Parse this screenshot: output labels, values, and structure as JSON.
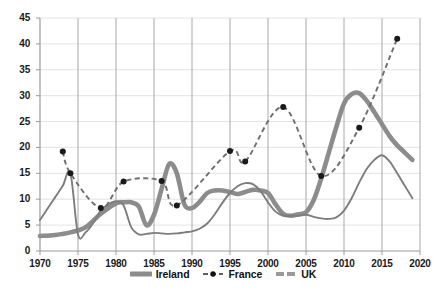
{
  "chart_data": {
    "type": "line",
    "title": "",
    "xlabel": "",
    "ylabel": "",
    "xlim": [
      1970,
      2020
    ],
    "ylim": [
      0,
      45
    ],
    "grid": true,
    "legend_position": "bottom-center",
    "x_ticks": [
      "1970",
      "1975",
      "1980",
      "1985",
      "1990",
      "1995",
      "2000",
      "2005",
      "2010",
      "2015",
      "2020"
    ],
    "y_ticks": [
      "0",
      "5",
      "10",
      "15",
      "20",
      "25",
      "30",
      "35",
      "40",
      "45"
    ],
    "series": [
      {
        "name": "Ireland",
        "color": "#8c8c8c",
        "style": "solid-thick",
        "x": [
          1970,
          1972,
          1974,
          1976,
          1978,
          1980,
          1981,
          1982,
          1983,
          1984,
          1985,
          1986,
          1987,
          1988,
          1989,
          1990,
          1991,
          1992,
          1993,
          1994,
          1995,
          1996,
          1997,
          1998,
          1999,
          2000,
          2001,
          2002,
          2003,
          2004,
          2005,
          2006,
          2007,
          2008,
          2009,
          2010,
          2011,
          2012,
          2013,
          2014,
          2015,
          2016,
          2017,
          2018,
          2019
        ],
        "values": [
          2.9,
          3.1,
          3.6,
          4.6,
          7.2,
          9.2,
          9.4,
          9.4,
          8.6,
          5.0,
          7.0,
          12.0,
          16.8,
          15.0,
          9.0,
          8.3,
          9.5,
          11.2,
          11.7,
          11.7,
          11.4,
          11.0,
          11.4,
          11.8,
          11.7,
          11.2,
          9.0,
          7.2,
          6.8,
          7.1,
          7.5,
          9.8,
          14.0,
          19.0,
          24.0,
          28.5,
          30.3,
          30.5,
          29.0,
          26.8,
          24.5,
          22.2,
          20.4,
          19.0,
          17.6
        ]
      },
      {
        "name": "France",
        "color": "#6e6e6e",
        "marker_color": "#1a1a1a",
        "style": "dashed-marker",
        "x": [
          1973,
          1974,
          1978,
          1981,
          1986,
          1988,
          1995,
          1997,
          2002,
          2007,
          2012,
          2017
        ],
        "values": [
          19.2,
          15.0,
          8.3,
          13.4,
          13.5,
          8.8,
          19.3,
          17.3,
          27.8,
          14.5,
          23.8,
          41.0
        ]
      },
      {
        "name": "UK",
        "color": "#9a9a9a",
        "style": "solid-thin",
        "x": [
          1970,
          1971,
          1972,
          1973,
          1974,
          1975,
          1976,
          1977,
          1978,
          1979,
          1980,
          1981,
          1982,
          1983,
          1984,
          1985,
          1986,
          1987,
          1988,
          1989,
          1990,
          1991,
          1992,
          1993,
          1994,
          1995,
          1996,
          1997,
          1998,
          1999,
          2000,
          2001,
          2002,
          2003,
          2004,
          2005,
          2006,
          2007,
          2008,
          2009,
          2010,
          2011,
          2012,
          2013,
          2014,
          2015,
          2016,
          2017,
          2018,
          2019
        ],
        "values": [
          6.0,
          8.2,
          10.4,
          12.6,
          15.0,
          3.2,
          3.6,
          5.4,
          7.8,
          9.0,
          9.6,
          8.8,
          4.6,
          3.2,
          3.3,
          3.5,
          3.4,
          3.3,
          3.4,
          3.6,
          3.8,
          4.3,
          5.3,
          7.1,
          9.3,
          11.2,
          12.5,
          13.1,
          12.9,
          11.6,
          9.4,
          7.6,
          6.8,
          6.8,
          6.8,
          7.0,
          6.6,
          6.3,
          6.2,
          6.5,
          7.8,
          10.2,
          13.2,
          15.9,
          17.6,
          18.5,
          17.3,
          15.0,
          12.6,
          10.2
        ]
      }
    ]
  },
  "legend": {
    "items": [
      {
        "label": "Ireland",
        "icon": "thick-line-swatch"
      },
      {
        "label": "France",
        "icon": "dashed-marker-swatch"
      },
      {
        "label": "UK",
        "icon": "dashed-line-swatch"
      }
    ]
  }
}
